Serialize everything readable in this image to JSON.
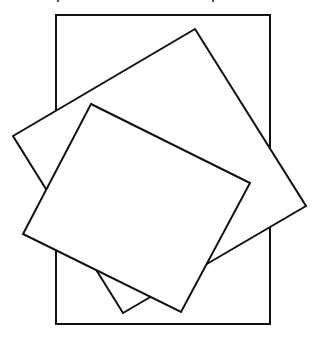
{
  "figure": {
    "stroke_color": "#111111",
    "fill_color": "#ffffff",
    "background": "#ffffff",
    "shapes": [
      {
        "name": "outer-rectangle",
        "points": "56,15 270,15 270,324 56,324"
      },
      {
        "name": "large-tilted-square",
        "points": "195,29 306,206 123,313 13,136"
      },
      {
        "name": "small-tilted-square",
        "points": "91,104 250,183 181,312 23,234"
      }
    ],
    "cutoff_text_fragments": [
      {
        "x": 57
      },
      {
        "x": 212
      }
    ]
  }
}
